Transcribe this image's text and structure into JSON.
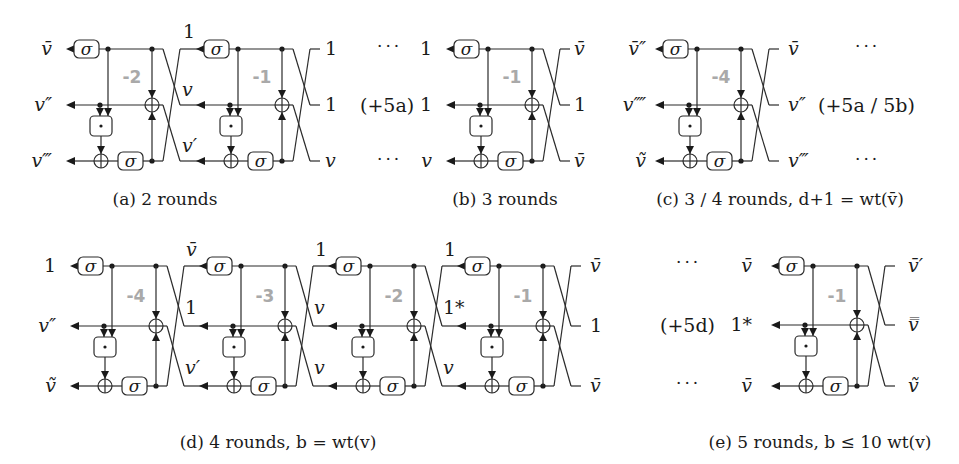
{
  "figure": {
    "node_labels": {
      "sigma": "σ",
      "dot": "·"
    },
    "panels": [
      {
        "id": "a",
        "caption": "(a) 2 rounds",
        "caption_x": 165,
        "caption_y": 205,
        "wires_y": [
          49,
          105,
          161
        ],
        "rounds": [
          {
            "x0": 66,
            "round_label": "-2"
          },
          {
            "x0": 196,
            "round_label": "-1"
          }
        ],
        "left_labels": [
          "v̄",
          "v″",
          "v‴"
        ],
        "left_label_x": 52,
        "mid_labels": [
          {
            "text": "1",
            "x": 183,
            "y": 38
          },
          {
            "text": "v",
            "x": 182,
            "y": 96
          },
          {
            "text": "v′",
            "x": 182,
            "y": 152
          }
        ],
        "right_labels": [
          "1",
          "1",
          "v"
        ],
        "right_label_x": 325,
        "left_notes": [],
        "right_notes": [],
        "ellipsis_left": [],
        "ellipsis_right": []
      },
      {
        "id": "b",
        "caption": "(b) 3 rounds",
        "caption_x": 505,
        "caption_y": 205,
        "wires_y": [
          49,
          105,
          161
        ],
        "rounds": [
          {
            "x0": 446,
            "round_label": "-1"
          }
        ],
        "left_labels": [
          "1",
          "1",
          "v"
        ],
        "left_label_x": 432,
        "mid_labels": [],
        "right_labels": [
          "v̄",
          "1",
          "v̄"
        ],
        "right_label_x": 574,
        "left_notes": [
          {
            "text": "(+5a)",
            "x": 360,
            "y": 112
          }
        ],
        "right_notes": [],
        "ellipsis_left": [
          {
            "x": 377,
            "y": 52
          },
          {
            "x": 377,
            "y": 165
          }
        ],
        "ellipsis_right": []
      },
      {
        "id": "c",
        "caption": "(c) 3 / 4 rounds, d+1 = wt(v̄)",
        "caption_x": 780,
        "caption_y": 205,
        "wires_y": [
          49,
          105,
          161
        ],
        "rounds": [
          {
            "x0": 655,
            "round_label": "-4"
          }
        ],
        "left_labels": [
          "v̄″",
          "v⁗",
          "ṽ"
        ],
        "left_label_x": 646,
        "mid_labels": [],
        "right_labels": [
          "v̄",
          "v″",
          "v‴"
        ],
        "right_label_x": 788,
        "left_notes": [],
        "right_notes": [
          {
            "text": "(+5a / 5b)",
            "x": 818,
            "y": 112
          }
        ],
        "ellipsis_left": [],
        "ellipsis_right": [
          {
            "x": 855,
            "y": 52
          },
          {
            "x": 855,
            "y": 165
          }
        ]
      },
      {
        "id": "d",
        "caption": "(d) 4 rounds, b = wt(v)",
        "caption_x": 278,
        "caption_y": 448,
        "wires_y": [
          266,
          326,
          386
        ],
        "rounds": [
          {
            "x0": 70,
            "round_label": "-4"
          },
          {
            "x0": 199,
            "round_label": "-3"
          },
          {
            "x0": 328,
            "round_label": "-2"
          },
          {
            "x0": 457,
            "round_label": "-1"
          }
        ],
        "left_labels": [
          "1",
          "v″",
          "ṽ"
        ],
        "left_label_x": 56,
        "mid_labels": [
          {
            "text": "v̄",
            "x": 186,
            "y": 256
          },
          {
            "text": "1",
            "x": 185,
            "y": 314
          },
          {
            "text": "v′",
            "x": 185,
            "y": 374
          },
          {
            "text": "1",
            "x": 315,
            "y": 256
          },
          {
            "text": "v",
            "x": 314,
            "y": 314
          },
          {
            "text": "v",
            "x": 314,
            "y": 374
          },
          {
            "text": "1",
            "x": 444,
            "y": 256
          },
          {
            "text": "1*",
            "x": 443,
            "y": 314
          },
          {
            "text": "v",
            "x": 443,
            "y": 374
          }
        ],
        "right_labels": [
          "v̄",
          "1",
          "v̄"
        ],
        "right_label_x": 590,
        "left_notes": [],
        "right_notes": [],
        "ellipsis_left": [],
        "ellipsis_right": []
      },
      {
        "id": "e",
        "caption": "(e) 5 rounds, b ≤ 10 wt(v)",
        "caption_x": 820,
        "caption_y": 448,
        "wires_y": [
          266,
          325,
          386
        ],
        "rounds": [
          {
            "x0": 771,
            "round_label": "-1"
          }
        ],
        "left_labels": [
          "v̄",
          "1*",
          "v̄"
        ],
        "left_label_x": 752,
        "mid_labels": [],
        "right_labels": [
          "v̄′",
          "v̿",
          "ṽ"
        ],
        "right_label_x": 908,
        "left_notes": [
          {
            "text": "(+5d)",
            "x": 660,
            "y": 332
          }
        ],
        "right_notes": [],
        "ellipsis_left": [
          {
            "x": 676,
            "y": 268
          },
          {
            "x": 676,
            "y": 389
          }
        ],
        "ellipsis_right": []
      }
    ]
  }
}
